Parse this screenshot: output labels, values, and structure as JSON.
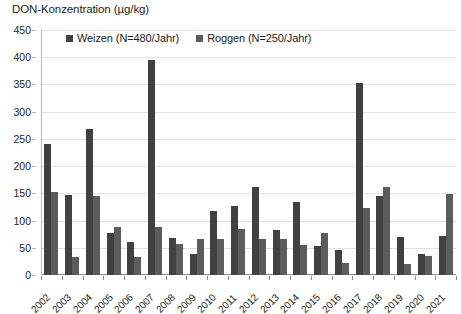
{
  "chart_data": {
    "type": "bar",
    "title": "DON-Konzentration (µg/kg)",
    "xlabel": "",
    "ylabel": "",
    "ylim": [
      0,
      450
    ],
    "ytick_step": 50,
    "yticks": [
      0,
      50,
      100,
      150,
      200,
      250,
      300,
      350,
      400,
      450
    ],
    "grid": true,
    "legend_position": "top-center",
    "categories": [
      "2002",
      "2003",
      "2004",
      "2005",
      "2006",
      "2007",
      "2008",
      "2009",
      "2010",
      "2011",
      "2012",
      "2013",
      "2014",
      "2015",
      "2016",
      "2017",
      "2018",
      "2019",
      "2020",
      "2021"
    ],
    "series": [
      {
        "name": "Weizen (N=480/Jahr)",
        "color": "#414141",
        "values": [
          240,
          147,
          269,
          78,
          60,
          395,
          68,
          38,
          117,
          126,
          162,
          82,
          135,
          53,
          46,
          353,
          146,
          70,
          38,
          72
        ]
      },
      {
        "name": "Roggen (N=250/Jahr)",
        "color": "#5c5c5c",
        "values": [
          152,
          33,
          145,
          88,
          33,
          88,
          57,
          66,
          67,
          85,
          66,
          66,
          55,
          77,
          22,
          123,
          162,
          21,
          35,
          148
        ]
      }
    ]
  },
  "legend": {
    "entries": [
      {
        "label": "Weizen (N=480/Jahr)",
        "color": "#414141"
      },
      {
        "label": "Roggen (N=250/Jahr)",
        "color": "#5c5c5c"
      }
    ]
  }
}
